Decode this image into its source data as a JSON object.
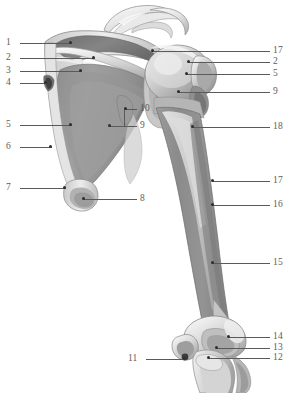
{
  "figure": {
    "background_color": "#ffffff",
    "label_color": "#5c5c5c",
    "leader_color": "#5a5a5a",
    "bone_fill_light": "#efefef",
    "bone_fill_mid": "#b9b9b9",
    "bone_fill_dark": "#8f8f8f",
    "fossa_fill": "#9a9a9a"
  },
  "labels": {
    "left": [
      {
        "id": "1",
        "text": "1",
        "x": 6,
        "y": 38,
        "line_x1": 20,
        "line_x2": 72,
        "line_y": 43,
        "dot_x": 70,
        "dot_y": 42
      },
      {
        "id": "2",
        "text": "2",
        "x": 6,
        "y": 53,
        "line_x1": 20,
        "line_x2": 95,
        "line_y": 58,
        "dot_x": 93,
        "dot_y": 57
      },
      {
        "id": "3",
        "text": "3",
        "x": 6,
        "y": 66,
        "line_x1": 20,
        "line_x2": 82,
        "line_y": 71,
        "dot_x": 80,
        "dot_y": 70
      },
      {
        "id": "4",
        "text": "4",
        "x": 6,
        "y": 78,
        "line_x1": 20,
        "line_x2": 47,
        "line_y": 83,
        "dot_x": 45,
        "dot_y": 82
      },
      {
        "id": "5",
        "text": "5",
        "x": 6,
        "y": 120,
        "line_x1": 20,
        "line_x2": 72,
        "line_y": 125,
        "dot_x": 70,
        "dot_y": 124
      },
      {
        "id": "6",
        "text": "6",
        "x": 6,
        "y": 142,
        "line_x1": 20,
        "line_x2": 52,
        "line_y": 147,
        "dot_x": 50,
        "dot_y": 146
      },
      {
        "id": "7",
        "text": "7",
        "x": 6,
        "y": 183,
        "line_x1": 20,
        "line_x2": 66,
        "line_y": 188,
        "dot_x": 64,
        "dot_y": 187
      },
      {
        "id": "11",
        "text": "11",
        "x": 128,
        "y": 354,
        "line_x1": 146,
        "line_x2": 186,
        "line_y": 359,
        "dot_x": 184,
        "dot_y": 358
      }
    ],
    "right": [
      {
        "id": "17a",
        "text": "17",
        "x": 273,
        "y": 46,
        "line_x1": 152,
        "line_x2": 270,
        "line_y": 51,
        "dot_x": 152,
        "dot_y": 50
      },
      {
        "id": "2r",
        "text": "2",
        "x": 273,
        "y": 57,
        "line_x1": 188,
        "line_x2": 270,
        "line_y": 62,
        "dot_x": 188,
        "dot_y": 61
      },
      {
        "id": "5r",
        "text": "5",
        "x": 273,
        "y": 69,
        "line_x1": 186,
        "line_x2": 270,
        "line_y": 74,
        "dot_x": 186,
        "dot_y": 73
      },
      {
        "id": "9r",
        "text": "9",
        "x": 273,
        "y": 87,
        "line_x1": 178,
        "line_x2": 270,
        "line_y": 92,
        "dot_x": 178,
        "dot_y": 91
      },
      {
        "id": "18",
        "text": "18",
        "x": 273,
        "y": 122,
        "line_x1": 192,
        "line_x2": 270,
        "line_y": 127,
        "dot_x": 192,
        "dot_y": 126
      },
      {
        "id": "17b",
        "text": "17",
        "x": 273,
        "y": 176,
        "line_x1": 212,
        "line_x2": 270,
        "line_y": 181,
        "dot_x": 212,
        "dot_y": 180
      },
      {
        "id": "16",
        "text": "16",
        "x": 273,
        "y": 200,
        "line_x1": 212,
        "line_x2": 270,
        "line_y": 205,
        "dot_x": 212,
        "dot_y": 204
      },
      {
        "id": "15",
        "text": "15",
        "x": 273,
        "y": 258,
        "line_x1": 212,
        "line_x2": 270,
        "line_y": 263,
        "dot_x": 212,
        "dot_y": 262
      },
      {
        "id": "14",
        "text": "14",
        "x": 273,
        "y": 332,
        "line_x1": 228,
        "line_x2": 270,
        "line_y": 337,
        "dot_x": 228,
        "dot_y": 336
      },
      {
        "id": "13",
        "text": "13",
        "x": 273,
        "y": 343,
        "line_x1": 216,
        "line_x2": 270,
        "line_y": 348,
        "dot_x": 216,
        "dot_y": 347
      },
      {
        "id": "12",
        "text": "12",
        "x": 273,
        "y": 353,
        "line_x1": 208,
        "line_x2": 270,
        "line_y": 358,
        "dot_x": 208,
        "dot_y": 357
      }
    ],
    "center": [
      {
        "id": "10",
        "text": "10",
        "x": 140,
        "y": 104,
        "line_x1": 126,
        "line_x2": 137,
        "line_y": 109,
        "dot_x": 125,
        "dot_y": 108
      },
      {
        "id": "9c",
        "text": "9",
        "x": 140,
        "y": 121,
        "line_x1": 110,
        "line_x2": 137,
        "line_y": 126,
        "dot_x": 109,
        "dot_y": 125
      },
      {
        "id": "8",
        "text": "8",
        "x": 140,
        "y": 194,
        "line_x1": 84,
        "line_x2": 137,
        "line_y": 199,
        "dot_x": 83,
        "dot_y": 198
      }
    ],
    "brackets": [
      {
        "id": "bracket-9-10",
        "x": 124,
        "y1": 109,
        "y2": 126
      }
    ]
  }
}
